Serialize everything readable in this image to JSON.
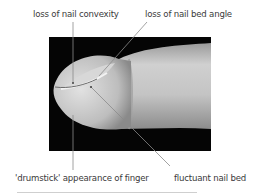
{
  "figure": {
    "labels": {
      "top_left": "loss of nail convexity",
      "top_right": "loss of nail bed angle",
      "bottom_left": "'drumstick' appearance of finger",
      "bottom_right": "fluctuant nail bed"
    },
    "photo": {
      "subject": "clubbed finger, lateral view",
      "background_color": "#050505",
      "skin_color": "#c8c8c8"
    },
    "leader_line_color": "#8a8a8a"
  }
}
